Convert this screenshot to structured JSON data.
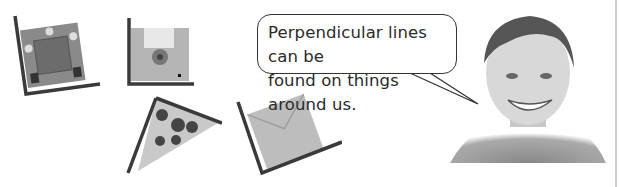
{
  "speech_bubble": {
    "line1": "Perpendicular lines can be",
    "line2": "found on things around us."
  },
  "illustrations": [
    {
      "name": "picture-frame"
    },
    {
      "name": "floppy-disk"
    },
    {
      "name": "pizza-slice"
    },
    {
      "name": "envelope"
    },
    {
      "name": "smiling-boy"
    }
  ]
}
